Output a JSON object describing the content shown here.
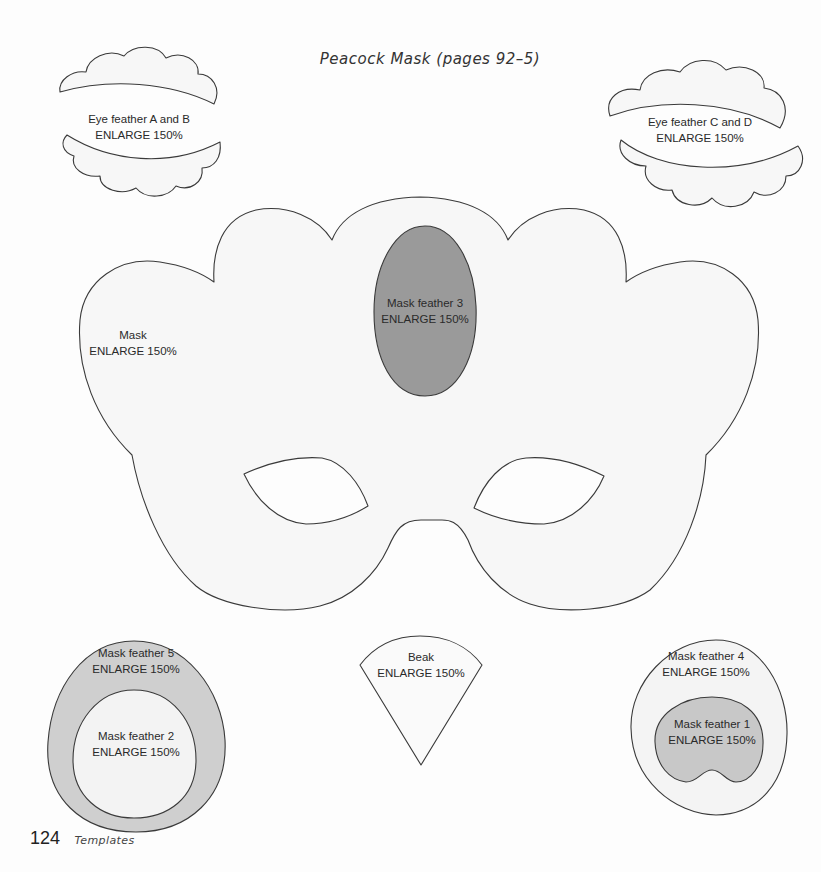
{
  "page": {
    "title": "Peacock Mask (pages 92–5)",
    "footer": {
      "page_number": "124",
      "section": "Templates"
    },
    "colors": {
      "background": "#fdfdfd",
      "outline": "#3a3a3a",
      "light_fill": "#f6f6f6",
      "mid_fill": "#cfcfcf",
      "dark_fill": "#9a9a9a",
      "text": "#2a2a2a"
    }
  },
  "templates": {
    "eye_feather_ab": {
      "name": "Eye feather A and B",
      "instruction": "ENLARGE 150%"
    },
    "eye_feather_cd": {
      "name": "Eye feather C and D",
      "instruction": "ENLARGE 150%"
    },
    "mask": {
      "name": "Mask",
      "instruction": "ENLARGE 150%"
    },
    "mask_feather_3": {
      "name": "Mask feather 3",
      "instruction": "ENLARGE 150%"
    },
    "mask_feather_5": {
      "name": "Mask feather 5",
      "instruction": "ENLARGE 150%"
    },
    "mask_feather_2": {
      "name": "Mask feather 2",
      "instruction": "ENLARGE 150%"
    },
    "beak": {
      "name": "Beak",
      "instruction": "ENLARGE 150%"
    },
    "mask_feather_4": {
      "name": "Mask feather 4",
      "instruction": "ENLARGE 150%"
    },
    "mask_feather_1": {
      "name": "Mask feather 1",
      "instruction": "ENLARGE 150%"
    }
  }
}
